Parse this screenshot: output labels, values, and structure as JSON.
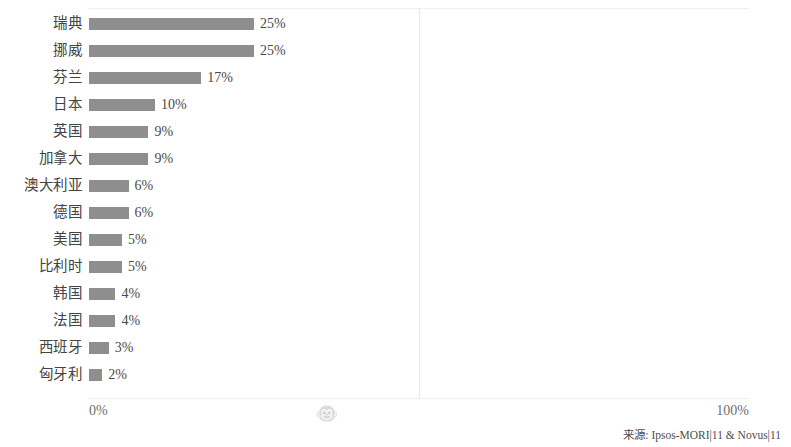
{
  "chart_data": {
    "type": "bar",
    "orientation": "horizontal",
    "title": "",
    "subtitle": "",
    "xlabel": "",
    "ylabel": "",
    "xlim": [
      0,
      100
    ],
    "grid": true,
    "legend": null,
    "categories": [
      "瑞典",
      "挪威",
      "芬兰",
      "日本",
      "英国",
      "加拿大",
      "澳大利亚",
      "德国",
      "美国",
      "比利时",
      "韩国",
      "法国",
      "西班牙",
      "匈牙利"
    ],
    "values": [
      25,
      25,
      17,
      10,
      9,
      9,
      6,
      6,
      5,
      5,
      4,
      4,
      3,
      2
    ],
    "value_labels": [
      "25%",
      "25%",
      "17%",
      "10%",
      "9%",
      "9%",
      "6%",
      "6%",
      "5%",
      "5%",
      "4%",
      "4%",
      "3%",
      "2%"
    ],
    "bar_color": "#8e8e8e",
    "axis_ticks": [
      {
        "value": 0,
        "label": "0%"
      },
      {
        "value": 50,
        "label": "monkey-face-icon"
      },
      {
        "value": 100,
        "label": "100%"
      }
    ]
  },
  "axis": {
    "left_tick_label": "0%",
    "right_tick_label": "100%",
    "mid_tick_glyph": "🐵",
    "mid_tick_icon_name": "monkey-face-icon"
  },
  "footer": {
    "source_text": "来源: Ipsos-MORI|11 & Novus|11"
  }
}
